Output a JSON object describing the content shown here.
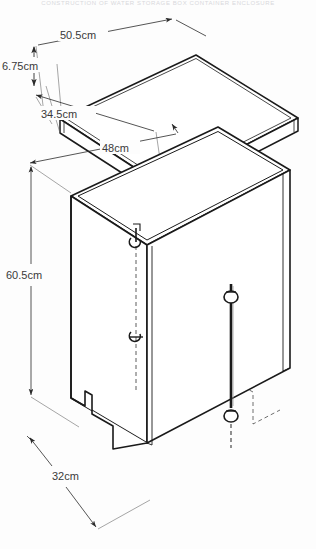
{
  "page": {
    "background_color": "#fdfdfd",
    "ink_color": "#1a1a1a",
    "header_text": "CONSTRUCTION OF WATER STORAGE BOX CONTAINER ENCLOSURE"
  },
  "drawing": {
    "title": "Isometric construction drawing of lid and box body",
    "units": "cm",
    "lid": {
      "name": "lid-assembly",
      "dimensions": [
        {
          "id": "lid-length",
          "label": "50.5cm",
          "value": 50.5,
          "unit": "cm",
          "axis": "length"
        },
        {
          "id": "lid-height",
          "label": "6.75cm",
          "value": 6.75,
          "unit": "cm",
          "axis": "height"
        },
        {
          "id": "lid-depth",
          "label": "34.5cm",
          "value": 34.5,
          "unit": "cm",
          "axis": "depth"
        }
      ]
    },
    "body": {
      "name": "box-body-assembly",
      "dimensions": [
        {
          "id": "body-width",
          "label": "48cm",
          "value": 48,
          "unit": "cm",
          "axis": "width"
        },
        {
          "id": "body-height",
          "label": "60.5cm",
          "value": 60.5,
          "unit": "cm",
          "axis": "height"
        },
        {
          "id": "body-depth",
          "label": "32cm",
          "value": 32,
          "unit": "cm",
          "axis": "depth"
        }
      ],
      "features": [
        {
          "id": "front-notch",
          "label": "stepped bottom notch"
        },
        {
          "id": "latch-hook-upper",
          "label": "upper hook fitting"
        },
        {
          "id": "latch-hook-lower",
          "label": "lower hook fitting"
        },
        {
          "id": "rod-clamp-upper",
          "label": "upper rod clamp"
        },
        {
          "id": "rod-clamp-lower",
          "label": "lower rod clamp"
        },
        {
          "id": "vertical-rod",
          "label": "vertical locking rod"
        }
      ]
    }
  }
}
